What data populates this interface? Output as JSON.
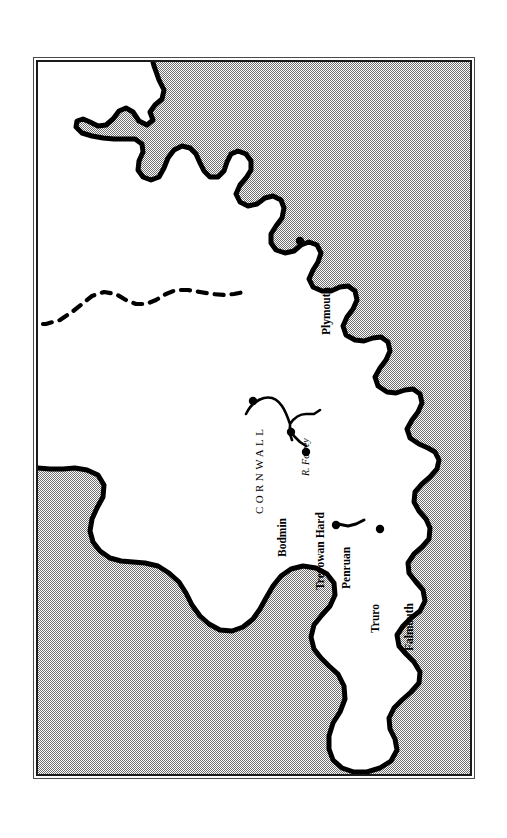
{
  "map": {
    "title": "Cornwall",
    "region_label": "CORNWALL",
    "river_label": "R. Fowey",
    "colors": {
      "sea": "#8c8c8c",
      "land": "#ffffff",
      "coastline": "#000000",
      "frame_outer": "#4a4a4a",
      "frame_inner": "#1a1a1a",
      "label": "#000000",
      "page": "#ffffff"
    },
    "frame": {
      "x": 33,
      "y": 57,
      "width": 442,
      "height": 722
    },
    "places": [
      {
        "name": "Plymouth",
        "x": 295,
        "y": 236,
        "marker": true,
        "label_x": 283,
        "label_y": 273,
        "rotation": -90
      },
      {
        "name": "Bodmin",
        "x": 248,
        "y": 396,
        "marker": true,
        "label_x": 239,
        "label_y": 495,
        "rotation": -90
      },
      {
        "name": "Trevowan Hard",
        "x": 286,
        "y": 427,
        "marker": true,
        "label_x": 277,
        "label_y": 528,
        "rotation": -90
      },
      {
        "name": "Penruan",
        "x": 301,
        "y": 447,
        "marker": true,
        "label_x": 303,
        "label_y": 527,
        "rotation": -90
      },
      {
        "name": "Truro",
        "x": 331,
        "y": 520,
        "marker": true,
        "label_x": 332,
        "label_y": 571,
        "rotation": -90
      },
      {
        "name": "Falmouth",
        "x": 375,
        "y": 524,
        "marker": true,
        "label_x": 366,
        "label_y": 589,
        "rotation": -90
      }
    ],
    "region": {
      "label_x": 216,
      "label_y": 452,
      "rotation": -90
    },
    "river": {
      "label_x": 263,
      "label_y": 414,
      "rotation": -90
    },
    "features": {
      "county_boundary": "dashed",
      "sea_fill": "halftone-dither",
      "labels_rotated": true
    }
  }
}
